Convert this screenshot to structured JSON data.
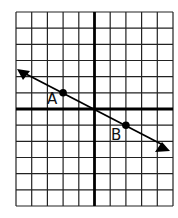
{
  "diagram": {
    "type": "coordinate-grid-with-line",
    "grid": {
      "columns": 10,
      "rows": 12,
      "x_range": [
        -5,
        5
      ],
      "y_range": [
        -6,
        6
      ],
      "y_axis_column": 5,
      "x_axis_row": 6
    },
    "line": {
      "through": [
        [
          -2,
          1
        ],
        [
          2,
          -1
        ]
      ],
      "slope": -0.5,
      "y_intercept": 0,
      "arrows": "both"
    },
    "points": [
      {
        "label": "A",
        "x": -2,
        "y": 1
      },
      {
        "label": "B",
        "x": 2,
        "y": -1
      }
    ],
    "colors": {
      "grid": "#222222",
      "axis": "#000000",
      "line": "#000000",
      "background": "#ffffff"
    }
  }
}
